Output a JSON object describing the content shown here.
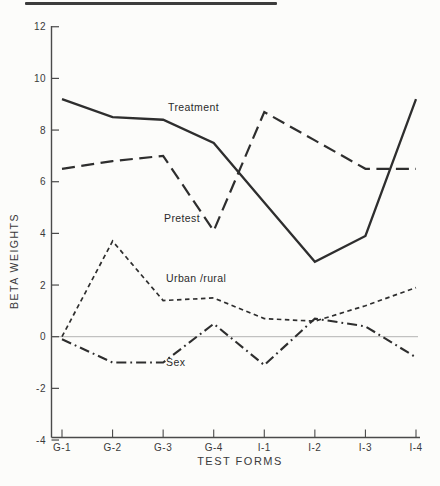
{
  "figure": {
    "background": "#fcfcfa",
    "line_color": "#2e2e2e",
    "axis_color": "#4a4a4a",
    "zero_line_color": "#b3b3b3",
    "tick_label_color": "#3a3a3a"
  },
  "chart_data": {
    "type": "line",
    "title": "",
    "xlabel": "TEST FORMS",
    "ylabel": "BETA WEIGHTS",
    "categories": [
      "G-1",
      "G-2",
      "G-3",
      "G-4",
      "I-1",
      "I-2",
      "I-3",
      "I-4"
    ],
    "ylim": [
      -4,
      12
    ],
    "yticks": [
      12,
      10,
      8,
      6,
      4,
      2,
      0,
      -2,
      -4
    ],
    "grid": "off",
    "zero_reference_line": true,
    "legend_position": "inline-labels-on-lines",
    "series": [
      {
        "name": "Treatment",
        "style": "solid",
        "values": [
          9.2,
          8.5,
          8.4,
          7.5,
          5.2,
          2.9,
          3.9,
          9.2
        ]
      },
      {
        "name": "Pretest",
        "style": "long-dash",
        "values": [
          6.5,
          6.8,
          7.0,
          4.1,
          8.7,
          7.6,
          6.5,
          6.5
        ]
      },
      {
        "name": "Urban /rural",
        "style": "short-dash",
        "values": [
          0.0,
          3.7,
          1.4,
          1.5,
          0.7,
          0.6,
          1.2,
          1.9
        ]
      },
      {
        "name": "Sex",
        "style": "dash-dot",
        "values": [
          -0.1,
          -1.0,
          -1.0,
          0.5,
          -1.1,
          0.7,
          0.4,
          -0.8
        ]
      }
    ]
  }
}
